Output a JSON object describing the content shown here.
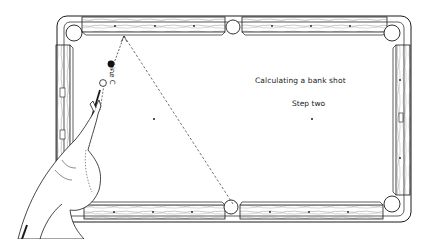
{
  "diagram": {
    "title": "Calculating a bank shot",
    "step": "Step two",
    "line_label": "Line C",
    "colors": {
      "ink": "#1a1a1a",
      "background": "#ffffff",
      "wood_grain": "#555555"
    },
    "elements": {
      "table": "pool-table",
      "pockets": 6,
      "object_ball": "solid black ball",
      "cue_ball": "white ball",
      "aim_line": "dashed bank line from top rail to bottom side pocket"
    }
  }
}
